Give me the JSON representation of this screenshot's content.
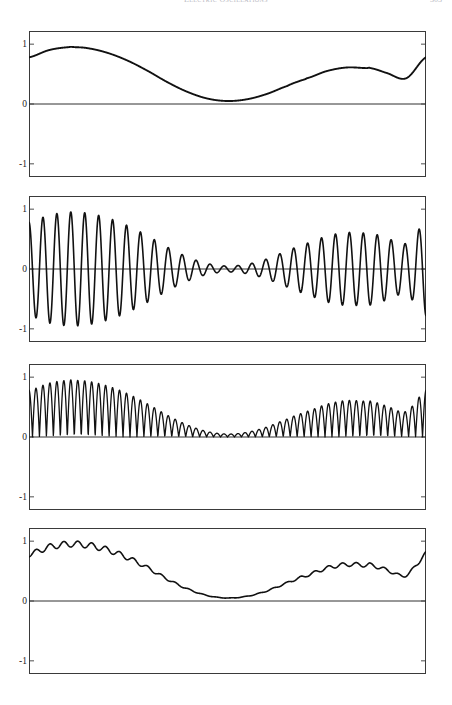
{
  "page": {
    "running_head": "Electric Oscillations",
    "page_number": "303"
  },
  "axis": {
    "tick_labels": [
      "1",
      "0",
      "-1"
    ],
    "tick_values": [
      1,
      0,
      -1
    ],
    "ymin": -1.22,
    "ymax": 1.22
  },
  "chart_data": {
    "type": "line",
    "title": "",
    "xlabel": "",
    "ylabel": "",
    "grid": false,
    "legend": false,
    "x_range": [
      0,
      1
    ],
    "ylim": [
      -1.22,
      1.22
    ],
    "yticks": [
      -1,
      0,
      1
    ],
    "ytick_labels": [
      "-1",
      "0",
      "1"
    ],
    "n_points": 1600,
    "panels": [
      {
        "index": 1,
        "name": "envelope",
        "description": "Smooth low-frequency modulating envelope, strictly positive",
        "formula": "0.5*(1 + 0.45*cos(2*pi*1.15*x + 0.62) + 0.42*cos(2*pi*2.35*x + 1.95))",
        "line_width": 1.9,
        "samples_x": [
          0.0,
          0.05,
          0.1,
          0.115,
          0.15,
          0.2,
          0.25,
          0.3,
          0.35,
          0.4,
          0.45,
          0.5,
          0.55,
          0.6,
          0.65,
          0.68,
          0.7,
          0.75,
          0.8,
          0.85,
          0.86,
          0.9,
          0.95,
          1.0
        ],
        "samples_y": [
          0.78,
          0.9,
          0.95,
          0.95,
          0.93,
          0.85,
          0.72,
          0.55,
          0.36,
          0.2,
          0.09,
          0.05,
          0.08,
          0.17,
          0.3,
          0.38,
          0.43,
          0.55,
          0.61,
          0.6,
          0.6,
          0.52,
          0.43,
          0.78
        ],
        "peaks": [
          {
            "x": 0.115,
            "y": 0.95
          },
          {
            "x": 0.7,
            "y": 0.62
          }
        ],
        "troughs": [
          {
            "x": 0.5,
            "y": 0.05
          },
          {
            "x": 0.86,
            "y": 0.42
          }
        ],
        "y_start": 0.78,
        "y_end": 0.78
      },
      {
        "index": 2,
        "name": "modulated-carrier",
        "description": "Carrier oscillation symmetric about zero with the panel-1 envelope as amplitude",
        "formula": "envelope(x) * cos(2*pi*28.5*x)",
        "carrier_cycles": 28.5,
        "line_width": 1.6,
        "amplitude_max": 0.95,
        "amplitude_min": 0.05,
        "symmetric_about_zero": true
      },
      {
        "index": 3,
        "name": "rectified-power",
        "description": "All-positive rectified oscillation at twice the carrier rate, bounded by the panel-1 envelope",
        "formula": "envelope(x) * |cos(2*pi*28.5*x)|",
        "lobe_count": 57,
        "line_width": 1.3,
        "min_value": 0.0,
        "max_value": 0.95
      },
      {
        "index": 4,
        "name": "smoothed-ripple",
        "description": "Panel-1 envelope with a small residual high-frequency ripple riding on it",
        "formula": "envelope(x) + 0.055*envelope(x)*cos(2*pi*28.5*x + pi)",
        "ripple_cycles": 28.5,
        "ripple_amplitude": 0.055,
        "line_width": 1.6,
        "min_value": 0.02,
        "max_value": 0.95
      }
    ]
  }
}
